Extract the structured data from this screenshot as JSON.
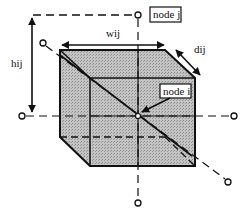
{
  "diagram": {
    "labels": {
      "node_j": "node j",
      "node_i": "node i",
      "width": "wij",
      "height": "hij",
      "depth": "dij"
    },
    "colors": {
      "cube_fill": "#b8b8b8",
      "line": "#111111",
      "background": "#ffffff"
    }
  }
}
